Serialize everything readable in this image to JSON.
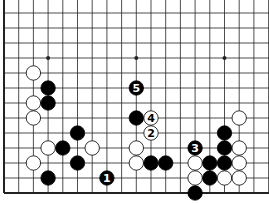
{
  "diagram": {
    "type": "go-board-fragment",
    "colors": {
      "background": "#ffffff",
      "line": "#222222",
      "black": "#000000",
      "white": "#ffffff"
    },
    "grid": {
      "columns": 19,
      "rows_visible": 13,
      "left_edge": true,
      "bottom_edge": true,
      "star_points": [
        [
          4,
          10
        ],
        [
          10,
          10
        ],
        [
          16,
          10
        ]
      ]
    },
    "stones": [
      {
        "color": "white",
        "col": 3,
        "row": 9
      },
      {
        "color": "black",
        "col": 4,
        "row": 8
      },
      {
        "color": "white",
        "col": 3,
        "row": 7
      },
      {
        "color": "black",
        "col": 4,
        "row": 7
      },
      {
        "color": "white",
        "col": 3,
        "row": 6
      },
      {
        "color": "black",
        "col": 6,
        "row": 5
      },
      {
        "color": "white",
        "col": 4,
        "row": 4
      },
      {
        "color": "black",
        "col": 5,
        "row": 4
      },
      {
        "color": "white",
        "col": 7,
        "row": 4
      },
      {
        "color": "white",
        "col": 3,
        "row": 3
      },
      {
        "color": "black",
        "col": 6,
        "row": 3
      },
      {
        "color": "black",
        "col": 4,
        "row": 2
      },
      {
        "color": "black",
        "col": 8,
        "row": 2,
        "label": "1"
      },
      {
        "color": "black",
        "col": 10,
        "row": 8,
        "label": "5"
      },
      {
        "color": "black",
        "col": 10,
        "row": 6
      },
      {
        "color": "white",
        "col": 11,
        "row": 6,
        "label": "4"
      },
      {
        "color": "white",
        "col": 11,
        "row": 5,
        "label": "2"
      },
      {
        "color": "white",
        "col": 10,
        "row": 4
      },
      {
        "color": "white",
        "col": 10,
        "row": 3
      },
      {
        "color": "black",
        "col": 11,
        "row": 3
      },
      {
        "color": "black",
        "col": 12,
        "row": 3
      },
      {
        "color": "white",
        "col": 17,
        "row": 6
      },
      {
        "color": "black",
        "col": 16,
        "row": 5
      },
      {
        "color": "black",
        "col": 14,
        "row": 4,
        "label": "3"
      },
      {
        "color": "black",
        "col": 16,
        "row": 4
      },
      {
        "color": "white",
        "col": 17,
        "row": 4
      },
      {
        "color": "white",
        "col": 14,
        "row": 3
      },
      {
        "color": "black",
        "col": 15,
        "row": 3
      },
      {
        "color": "black",
        "col": 16,
        "row": 3
      },
      {
        "color": "white",
        "col": 17,
        "row": 3
      },
      {
        "color": "white",
        "col": 14,
        "row": 2
      },
      {
        "color": "black",
        "col": 15,
        "row": 2
      },
      {
        "color": "white",
        "col": 16,
        "row": 2
      },
      {
        "color": "white",
        "col": 17,
        "row": 2
      },
      {
        "color": "black",
        "col": 14,
        "row": 1
      }
    ]
  }
}
